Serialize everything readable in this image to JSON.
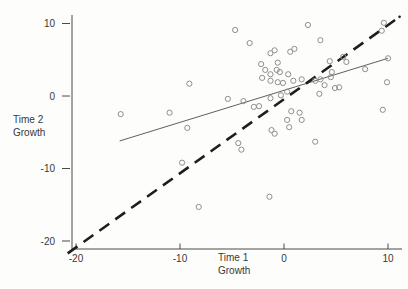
{
  "figure": {
    "y_axis_title_line1": "Time 2",
    "y_axis_title_line2": "Growth",
    "x_axis_title_line1": "Time 1",
    "x_axis_title_line2": "Growth"
  },
  "chart_data": {
    "type": "scatter",
    "title": "",
    "xlabel": "Time 1 Growth",
    "ylabel": "Time 2 Growth",
    "xlim": [
      -20.5,
      11.5
    ],
    "ylim": [
      -21.5,
      11.2
    ],
    "grid": false,
    "legend": "none",
    "x_ticks": [
      -20,
      -10,
      0,
      10
    ],
    "y_ticks": [
      10,
      0,
      -10,
      -20
    ],
    "points": [
      [
        -9.1,
        1.7
      ],
      [
        -4.7,
        9.1
      ],
      [
        2.3,
        9.8
      ],
      [
        -3.3,
        7.3
      ],
      [
        -1.3,
        5.9
      ],
      [
        -0.9,
        6.3
      ],
      [
        0.6,
        6.1
      ],
      [
        1.0,
        6.5
      ],
      [
        -2.2,
        4.4
      ],
      [
        -0.6,
        4.6
      ],
      [
        -1.8,
        3.6
      ],
      [
        -1.3,
        3.0
      ],
      [
        -0.7,
        3.6
      ],
      [
        -0.4,
        3.3
      ],
      [
        0.4,
        3.0
      ],
      [
        -2.1,
        2.5
      ],
      [
        -1.3,
        2.1
      ],
      [
        -0.6,
        1.9
      ],
      [
        -0.1,
        1.8
      ],
      [
        0.9,
        2.1
      ],
      [
        1.7,
        2.3
      ],
      [
        -5.4,
        -0.4
      ],
      [
        -3.9,
        -0.7
      ],
      [
        -2.9,
        -1.5
      ],
      [
        -2.4,
        -1.4
      ],
      [
        -1.3,
        -0.3
      ],
      [
        -0.3,
        0.1
      ],
      [
        0.3,
        0.6
      ],
      [
        0.7,
        -2.1
      ],
      [
        1.5,
        -2.3
      ],
      [
        0.3,
        -3.3
      ],
      [
        1.7,
        -3.3
      ],
      [
        0.5,
        -4.3
      ],
      [
        -1.2,
        -4.7
      ],
      [
        -0.9,
        -5.2
      ],
      [
        3.0,
        -6.3
      ],
      [
        -4.4,
        -6.5
      ],
      [
        -4.1,
        -7.4
      ],
      [
        3.5,
        7.7
      ],
      [
        4.4,
        4.8
      ],
      [
        5.7,
        5.4
      ],
      [
        6.0,
        4.7
      ],
      [
        4.6,
        3.3
      ],
      [
        4.5,
        2.6
      ],
      [
        3.0,
        2.1
      ],
      [
        3.5,
        2.3
      ],
      [
        3.9,
        1.5
      ],
      [
        4.9,
        1.1
      ],
      [
        5.3,
        1.2
      ],
      [
        7.8,
        3.7
      ],
      [
        9.9,
        1.9
      ],
      [
        10.0,
        5.2
      ],
      [
        -15.7,
        -2.5
      ],
      [
        -11.0,
        -2.3
      ],
      [
        -9.3,
        -4.4
      ],
      [
        -9.8,
        -9.2
      ],
      [
        3.4,
        0.3
      ],
      [
        9.5,
        -1.9
      ],
      [
        -8.2,
        -15.3
      ],
      [
        -1.4,
        -13.9
      ],
      [
        9.6,
        10.1
      ],
      [
        9.4,
        9.0
      ]
    ],
    "lines": [
      {
        "name": "regression-line",
        "style": "solid",
        "x1": -15.8,
        "y1": -6.2,
        "x2": 10.0,
        "y2": 5.2
      },
      {
        "name": "identity-line",
        "style": "dashed",
        "x1": -20.8,
        "y1": -21.7,
        "x2": 10.8,
        "y2": 10.6
      }
    ],
    "colors": {
      "point_stroke": "#8f8f8f",
      "solid_line": "#4d4d4d",
      "dashed_line": "#1e1e1e",
      "axis": "#4a4a4a",
      "text": "#383838"
    }
  }
}
